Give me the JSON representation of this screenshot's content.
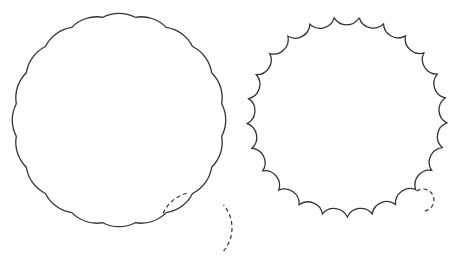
{
  "diagram": {
    "stroke_color": "#333333",
    "background": "#ffffff",
    "figures": [
      {
        "id": "left",
        "type": "outward-scallop",
        "center": [
          119,
          120
        ],
        "radius": 104,
        "segments": 20,
        "start_angle_deg": 81,
        "bulge": 4,
        "generator": {
          "center": [
            196,
            228
          ],
          "radius": 36,
          "dashed_arcs": [
            [
              -40,
              40
            ],
            [
              105,
              160
            ]
          ]
        }
      },
      {
        "id": "right",
        "type": "inward-scallop",
        "center": [
          347,
          117
        ],
        "radius": 100,
        "segments": 25,
        "start_angle_deg": 83,
        "bulge": 7,
        "generator": {
          "center": [
            423,
            200
          ],
          "radius": 11,
          "dashed_arcs": [
            [
              -80,
              140
            ]
          ]
        }
      }
    ]
  }
}
